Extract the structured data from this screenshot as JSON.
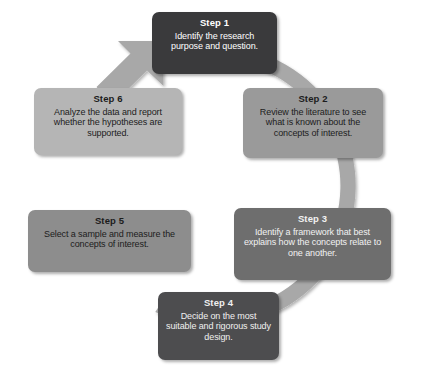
{
  "diagram": {
    "type": "cycle-diagram",
    "shape": "circular-ring-with-arrow",
    "ring": {
      "color": "#a8a8a8",
      "center_x": 212,
      "center_y": 190,
      "outer_radius": 140,
      "band_width": 15,
      "arrow_name": "cycle-arrow",
      "arrow_direction": "counter-clockwise-to-step-1",
      "arrow_tip_position": "upper-left, pointing up-right toward Step 1"
    },
    "steps": [
      {
        "id": "step-1",
        "title": "Step 1",
        "body": "Identify the research purpose and question.",
        "fill": "#3a3a3c",
        "text_color": "#ffffff",
        "position": "top"
      },
      {
        "id": "step-2",
        "title": "Step 2",
        "body": "Review the literature to see what is known about the concepts of interest.",
        "fill": "#9a9a9a",
        "text_color": "#1c1c1c",
        "position": "upper-right"
      },
      {
        "id": "step-3",
        "title": "Step 3",
        "body": "Identify a framework that best explains how the concepts relate to one another.",
        "fill": "#6e6e6e",
        "text_color": "#f2f2f2",
        "position": "lower-right"
      },
      {
        "id": "step-4",
        "title": "Step 4",
        "body": "Decide on the most suitable and rigorous study design.",
        "fill": "#4d4d4f",
        "text_color": "#f0f0f0",
        "position": "bottom"
      },
      {
        "id": "step-5",
        "title": "Step 5",
        "body": "Select a sample and measure the concepts of interest.",
        "fill": "#8d8d8d",
        "text_color": "#1c1c1c",
        "position": "lower-left"
      },
      {
        "id": "step-6",
        "title": "Step 6",
        "body": "Analyze the data and report whether the hypotheses are supported.",
        "fill": "#b5b5b5",
        "text_color": "#1c1c1c",
        "position": "upper-left"
      }
    ]
  }
}
